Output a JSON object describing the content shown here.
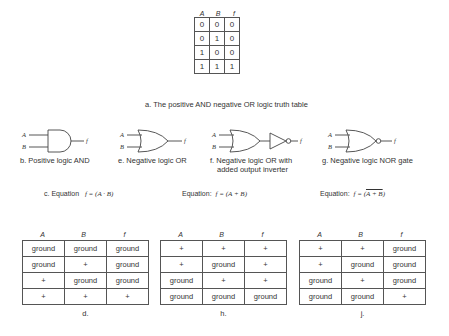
{
  "truth_table": {
    "headers": [
      "A",
      "B",
      "f"
    ],
    "rows": [
      [
        "0",
        "0",
        "0"
      ],
      [
        "0",
        "1",
        "0"
      ],
      [
        "1",
        "0",
        "0"
      ],
      [
        "1",
        "1",
        "1"
      ]
    ],
    "caption": "a. The positive AND negative OR logic truth table"
  },
  "gates": [
    {
      "id": "b",
      "inputs": [
        "A",
        "B"
      ],
      "output": "f",
      "type": "and",
      "caption": "b. Positive logic AND"
    },
    {
      "id": "e",
      "inputs": [
        "A",
        "B"
      ],
      "output": "f",
      "type": "or",
      "caption": "e. Negative logic OR"
    },
    {
      "id": "f",
      "inputs": [
        "A",
        "B"
      ],
      "output": "f",
      "type": "or-inverter",
      "caption_line1": "f. Negative logic OR with",
      "caption_line2": "added output inverter"
    },
    {
      "id": "g",
      "inputs": [
        "A",
        "B"
      ],
      "output": "f",
      "type": "nor",
      "caption": "g. Negative logic NOR gate"
    }
  ],
  "equations": [
    {
      "label": "c. Equation",
      "expr_lhs": "f = (",
      "expr_body": "A · B",
      "expr_rhs": ")",
      "overline": false
    },
    {
      "label": "Equation:",
      "expr_lhs": "f = (",
      "expr_body": "A + B",
      "expr_rhs": ")",
      "overline": false
    },
    {
      "label": "Equation:",
      "expr_lhs": "f = (",
      "expr_body": "A + B",
      "expr_rhs": ")",
      "overline": true
    }
  ],
  "level_tables": [
    {
      "id": "d",
      "headers": [
        "A",
        "B",
        "f"
      ],
      "rows": [
        [
          "ground",
          "ground",
          "ground"
        ],
        [
          "ground",
          "+",
          "ground"
        ],
        [
          "+",
          "ground",
          "ground"
        ],
        [
          "+",
          "+",
          "+"
        ]
      ],
      "label": "d."
    },
    {
      "id": "h",
      "headers": [
        "A",
        "B",
        "f"
      ],
      "rows": [
        [
          "+",
          "+",
          "+"
        ],
        [
          "+",
          "ground",
          "+"
        ],
        [
          "ground",
          "+",
          "+"
        ],
        [
          "ground",
          "ground",
          "ground"
        ]
      ],
      "label": "h."
    },
    {
      "id": "j",
      "headers": [
        "A",
        "B",
        "f"
      ],
      "rows": [
        [
          "+",
          "+",
          "ground"
        ],
        [
          "+",
          "ground",
          "ground"
        ],
        [
          "ground",
          "+",
          "ground"
        ],
        [
          "ground",
          "ground",
          "+"
        ]
      ],
      "label": "j."
    }
  ]
}
